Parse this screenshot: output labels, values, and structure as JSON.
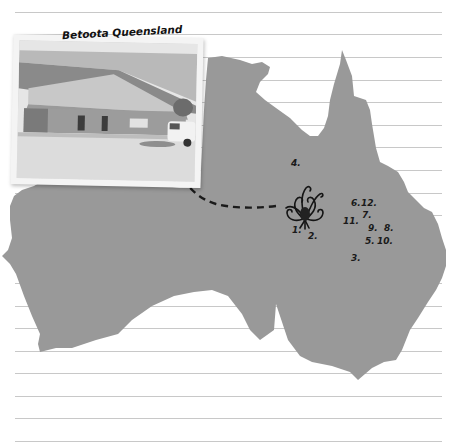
{
  "photo": {
    "caption": "Betoota Queensland",
    "subject": "single-storey building with pitched roof and parked car"
  },
  "map": {
    "region": "Australia",
    "fill_color": "#999999",
    "paper_line_color": "#c8c8c8",
    "markers": [
      {
        "id": "marker-1",
        "label": "1.",
        "x": 292,
        "y": 231
      },
      {
        "id": "marker-2",
        "label": "2.",
        "x": 308,
        "y": 237
      },
      {
        "id": "marker-3",
        "label": "3.",
        "x": 351,
        "y": 259
      },
      {
        "id": "marker-4",
        "label": "4.",
        "x": 291,
        "y": 164
      },
      {
        "id": "marker-5",
        "label": "5.",
        "x": 365,
        "y": 242
      },
      {
        "id": "marker-6",
        "label": "6.",
        "x": 351,
        "y": 204
      },
      {
        "id": "marker-7",
        "label": "7.",
        "x": 362,
        "y": 216
      },
      {
        "id": "marker-8",
        "label": "8.",
        "x": 384,
        "y": 229
      },
      {
        "id": "marker-9",
        "label": "9.",
        "x": 368,
        "y": 229
      },
      {
        "id": "marker-10",
        "label": "10.",
        "x": 377,
        "y": 242
      },
      {
        "id": "marker-11",
        "label": "11.",
        "x": 343,
        "y": 222
      },
      {
        "id": "marker-12",
        "label": "12.",
        "x": 361,
        "y": 204
      }
    ],
    "ornament": "decorative flourish / flower emblem",
    "arrow": "dashed arrow from emblem pointing to photo"
  }
}
